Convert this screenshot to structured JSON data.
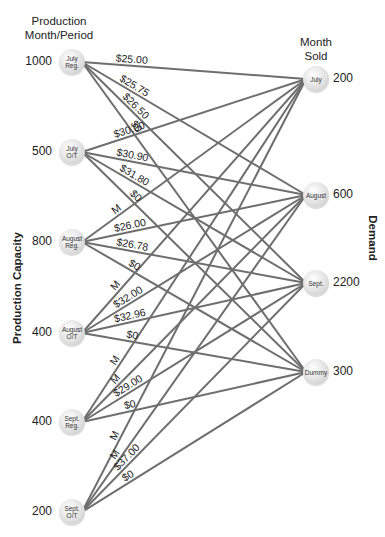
{
  "headers": {
    "production": "Production\nMonth/Period",
    "production_line1": "Production",
    "production_line2": "Month/Period",
    "sold_line1": "Month",
    "sold_line2": "Sold"
  },
  "axis_labels": {
    "left": "Production Capacity",
    "right": "Demand"
  },
  "sources": [
    {
      "id": "july-reg",
      "line1": "July",
      "line2": "Reg.",
      "capacity": "1000",
      "x": 72,
      "y": 62
    },
    {
      "id": "july-ot",
      "line1": "July",
      "line2": "O/T",
      "capacity": "500",
      "x": 72,
      "y": 152
    },
    {
      "id": "august-reg",
      "line1": "August",
      "line2": "Reg.",
      "capacity": "800",
      "x": 72,
      "y": 242
    },
    {
      "id": "august-ot",
      "line1": "August",
      "line2": "O/T",
      "capacity": "400",
      "x": 72,
      "y": 333
    },
    {
      "id": "sept-reg",
      "line1": "Sept.",
      "line2": "Reg.",
      "capacity": "400",
      "x": 72,
      "y": 422
    },
    {
      "id": "sept-ot",
      "line1": "Sept.",
      "line2": "O/T",
      "capacity": "200",
      "x": 72,
      "y": 512
    }
  ],
  "destinations": [
    {
      "id": "july",
      "label": "July",
      "demand": "200",
      "x": 316,
      "y": 79
    },
    {
      "id": "august",
      "label": "August",
      "demand": "600",
      "x": 316,
      "y": 195
    },
    {
      "id": "sept",
      "label": "Sept.",
      "demand": "2200",
      "x": 316,
      "y": 283
    },
    {
      "id": "dummy",
      "label": "Dummy",
      "demand": "300",
      "x": 316,
      "y": 372
    }
  ],
  "edges": [
    {
      "from": 0,
      "to": 0,
      "cost": "$25.00"
    },
    {
      "from": 0,
      "to": 1,
      "cost": "$25.75"
    },
    {
      "from": 0,
      "to": 2,
      "cost": "$26.50"
    },
    {
      "from": 0,
      "to": 3,
      "cost": "$0"
    },
    {
      "from": 1,
      "to": 0,
      "cost": "$30.00"
    },
    {
      "from": 1,
      "to": 1,
      "cost": "$30.90"
    },
    {
      "from": 1,
      "to": 2,
      "cost": "$31.80"
    },
    {
      "from": 1,
      "to": 3,
      "cost": "$0"
    },
    {
      "from": 2,
      "to": 0,
      "cost": "M"
    },
    {
      "from": 2,
      "to": 1,
      "cost": "$26.00"
    },
    {
      "from": 2,
      "to": 2,
      "cost": "$26.78"
    },
    {
      "from": 2,
      "to": 3,
      "cost": "$0"
    },
    {
      "from": 3,
      "to": 0,
      "cost": "M"
    },
    {
      "from": 3,
      "to": 1,
      "cost": "$32.00"
    },
    {
      "from": 3,
      "to": 2,
      "cost": "$32.96"
    },
    {
      "from": 3,
      "to": 3,
      "cost": "$0"
    },
    {
      "from": 4,
      "to": 0,
      "cost": "M"
    },
    {
      "from": 4,
      "to": 1,
      "cost": "M"
    },
    {
      "from": 4,
      "to": 2,
      "cost": "$29.00"
    },
    {
      "from": 4,
      "to": 3,
      "cost": "$0"
    },
    {
      "from": 5,
      "to": 0,
      "cost": "M"
    },
    {
      "from": 5,
      "to": 1,
      "cost": "M"
    },
    {
      "from": 5,
      "to": 2,
      "cost": "$37.00"
    },
    {
      "from": 5,
      "to": 3,
      "cost": "$0"
    }
  ],
  "colors": {
    "edge": "#6e6e6e",
    "node_light": "#ffffff",
    "node_dark": "#c4c4c4",
    "text": "#222222"
  }
}
